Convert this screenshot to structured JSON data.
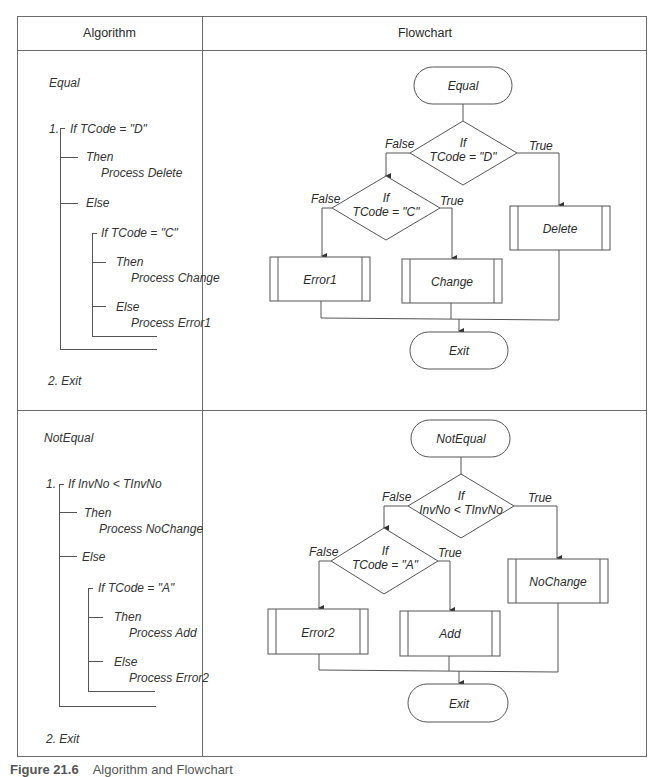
{
  "table": {
    "headers": {
      "algorithm": "Algorithm",
      "flowchart": "Flowchart"
    }
  },
  "sections": [
    {
      "algorithm": {
        "title": "Equal",
        "step1_num": "1.",
        "if1": "If TCode = \"D\"",
        "then1": "Then",
        "then1_action": "Process Delete",
        "else1": "Else",
        "if2": "If TCode = \"C\"",
        "then2": "Then",
        "then2_action": "Process Change",
        "else2": "Else",
        "else2_action": "Process Error1",
        "step2": "2. Exit"
      },
      "flowchart": {
        "start": "Equal",
        "decision1_line1": "If",
        "decision1_line2": "TCode = \"D\"",
        "decision1_false": "False",
        "decision1_true": "True",
        "decision2_line1": "If",
        "decision2_line2": "TCode = \"C\"",
        "decision2_false": "False",
        "decision2_true": "True",
        "process_true1": "Delete",
        "process_false2": "Error1",
        "process_true2": "Change",
        "end": "Exit"
      }
    },
    {
      "algorithm": {
        "title": "NotEqual",
        "step1_num": "1.",
        "if1": "If InvNo < TInvNo",
        "then1": "Then",
        "then1_action": "Process NoChange",
        "else1": "Else",
        "if2": "If TCode = \"A\"",
        "then2": "Then",
        "then2_action": "Process Add",
        "else2": "Else",
        "else2_action": "Process Error2",
        "step2": "2. Exit"
      },
      "flowchart": {
        "start": "NotEqual",
        "decision1_line1": "If",
        "decision1_line2": "InvNo < TInvNo",
        "decision1_false": "False",
        "decision1_true": "True",
        "decision2_line1": "If",
        "decision2_line2": "TCode = \"A\"",
        "decision2_false": "False",
        "decision2_true": "True",
        "process_true1": "NoChange",
        "process_false2": "Error2",
        "process_true2": "Add",
        "end": "Exit"
      }
    }
  ],
  "caption": {
    "label": "Figure 21.6",
    "text": "Algorithm and Flowchart"
  }
}
